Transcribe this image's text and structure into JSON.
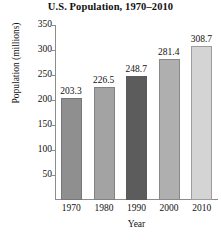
{
  "chart_data": {
    "type": "bar",
    "title": "U.S. Population, 1970–2010",
    "xlabel": "Year",
    "ylabel": "Population (millions)",
    "categories": [
      "1970",
      "1980",
      "1990",
      "2000",
      "2010"
    ],
    "values": [
      203.3,
      226.5,
      248.7,
      281.4,
      308.7
    ],
    "value_labels": [
      "203.3",
      "226.5",
      "248.7",
      "281.4",
      "308.7"
    ],
    "ylim": [
      0,
      350
    ],
    "ytick_labels": [
      "350",
      "300",
      "250",
      "200",
      "150",
      "100",
      "50"
    ],
    "ytick_values": [
      350,
      300,
      250,
      200,
      150,
      100,
      50
    ],
    "grid": false,
    "legend": false,
    "bar_colors": [
      "#8f8f8f",
      "#a3a3a3",
      "#5c5c5c",
      "#afafaf",
      "#d4d4d4"
    ],
    "axis_color": "#8c8c8c",
    "text_color": "#111111",
    "background": "#ffffff"
  }
}
